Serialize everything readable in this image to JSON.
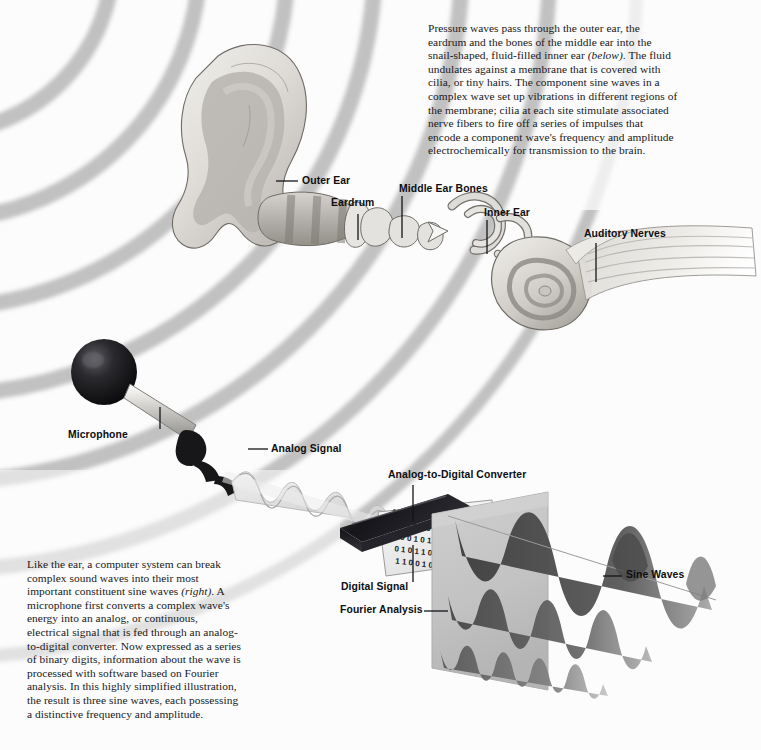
{
  "figure": {
    "medium": "grayscale airbrush illustration",
    "background_color": "#fcfcfc",
    "ink_color": "#0d0e10"
  },
  "captions": {
    "top": "Pressure waves pass through the outer ear, the eardrum and the bones of the middle ear into the snail-shaped, fluid-filled inner ear (below). The fluid undulates against a membrane that is covered with cilia, or tiny hairs. The component sine waves in a complex wave set up vibrations in different regions of the membrane; cilia at each site stimulate associated nerve fibers to fire off a series of impulses that encode a component wave's frequency and amplitude electrochemically for transmission to the brain.",
    "top_italic_word": "(below)",
    "bottom": "Like the ear, a computer system can break complex sound waves into their most important constituent sine waves (right). A microphone first converts a complex wave's energy into an analog, or continuous, electrical signal that is fed through an analog-to-digital converter. Now expressed as a series of binary digits, information about the wave is processed with software based on Fourier analysis. In this highly simplified illustration, the result is three sine waves, each possessing a distinctive frequency and amplitude.",
    "bottom_italic_word": "(right)"
  },
  "labels": [
    {
      "id": "outer-ear",
      "text": "Outer Ear"
    },
    {
      "id": "eardrum",
      "text": "Eardrum"
    },
    {
      "id": "middle-ear-bones",
      "text": "Middle Ear Bones"
    },
    {
      "id": "inner-ear",
      "text": "Inner Ear"
    },
    {
      "id": "auditory-nerves",
      "text": "Auditory Nerves"
    },
    {
      "id": "microphone",
      "text": "Microphone"
    },
    {
      "id": "analog-signal",
      "text": "Analog Signal"
    },
    {
      "id": "adc",
      "text": "Analog-to-Digital Converter"
    },
    {
      "id": "digital-signal",
      "text": "Digital Signal"
    },
    {
      "id": "fourier-analysis",
      "text": "Fourier Analysis"
    },
    {
      "id": "sine-waves",
      "text": "Sine Waves"
    }
  ],
  "digital_signal": {
    "description": "binary digits printed on the output ribbon of the converter",
    "rows": [
      "1 0 1 0 0 1 1 0",
      "0 1 1 0 1 0 0 1",
      "1 0 0 1 0 1 1 0",
      "0 1 0 1 1 0 0 1",
      "1 1 0 0 1 0 1 0"
    ]
  },
  "sound_waves": {
    "description": "concentric pressure-wave arcs radiating from upper left",
    "arc_count": 7,
    "color": "#bdbdbd"
  },
  "sine_waves": {
    "count": 3,
    "description": "three component sine waves of distinctive frequency and amplitude emerging from the Fourier analysis plane",
    "components": [
      {
        "name": "low frequency, high amplitude",
        "cycles": 2,
        "amplitude": 1.0,
        "shade": "#5a5a5a"
      },
      {
        "name": "mid frequency, mid amplitude",
        "cycles": 4,
        "amplitude": 0.6,
        "shade": "#6d6d6d"
      },
      {
        "name": "high frequency, low amplitude",
        "cycles": 8,
        "amplitude": 0.34,
        "shade": "#7e7e7e"
      }
    ]
  },
  "palette": {
    "paper": "#fcfcfc",
    "wave_gray": "#bdbdbd",
    "ear_light": "#e3e1dd",
    "ear_mid": "#b9b6b1",
    "ear_dark": "#8e8b86",
    "mic_dark": "#17171a",
    "adc_dark": "#1c1c1f",
    "plane_gray": "#c3c3c3",
    "sine_dark": "#555555",
    "ink": "#0d0e10"
  }
}
